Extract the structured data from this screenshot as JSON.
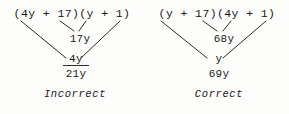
{
  "figure": {
    "caption_type": "factoring-middle-term-check",
    "panels": [
      {
        "id": "incorrect",
        "expression": "(4y + 17)(y + 1)",
        "factor_left": "(4y + 17)",
        "factor_right": "(y + 1)",
        "inner_product": "17y",
        "outer_product": "4y",
        "sum": "21y",
        "verdict": "Incorrect"
      },
      {
        "id": "correct",
        "expression": "(y + 17)(4y + 1)",
        "factor_left": "(y + 17)",
        "factor_right": "(4y + 1)",
        "inner_product": "68y",
        "outer_product": "y",
        "sum": "69y",
        "verdict": "Correct"
      }
    ]
  },
  "colors": {
    "ink": "#1a1a1a",
    "rule": "#2a2a2a",
    "connector": "#2b2b2b",
    "paper": "#fdfdfb"
  }
}
